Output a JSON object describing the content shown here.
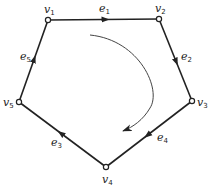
{
  "diagram": {
    "type": "directed-cycle-graph",
    "vertices": [
      {
        "id": "v1",
        "label": "v",
        "sub": "1",
        "x": 48,
        "y": 20,
        "lx": 44,
        "ly": 13
      },
      {
        "id": "v2",
        "label": "v",
        "sub": "2",
        "x": 159,
        "y": 19,
        "lx": 155,
        "ly": 12
      },
      {
        "id": "v3",
        "label": "v",
        "sub": "3",
        "x": 192,
        "y": 101,
        "lx": 197,
        "ly": 106
      },
      {
        "id": "v4",
        "label": "v",
        "sub": "4",
        "x": 106,
        "y": 167,
        "lx": 102,
        "ly": 183
      },
      {
        "id": "v5",
        "label": "v",
        "sub": "5",
        "x": 19,
        "y": 102,
        "lx": 3,
        "ly": 106
      }
    ],
    "edges": [
      {
        "id": "e1",
        "label": "e",
        "sub": "1",
        "from": "v1",
        "to": "v2",
        "lx": 99,
        "ly": 12
      },
      {
        "id": "e2",
        "label": "e",
        "sub": "2",
        "from": "v2",
        "to": "v3",
        "lx": 181,
        "ly": 60
      },
      {
        "id": "e3",
        "label": "e",
        "sub": "3",
        "from": "v4",
        "to": "v5",
        "lx": 51,
        "ly": 146
      },
      {
        "id": "e4",
        "label": "e",
        "sub": "4",
        "from": "v3",
        "to": "v4",
        "lx": 157,
        "ly": 141
      },
      {
        "id": "e5",
        "label": "e",
        "sub": "5",
        "from": "v5",
        "to": "v1",
        "lx": 20,
        "ly": 60
      }
    ],
    "orientation_arrow": {
      "direction": "clockwise"
    },
    "colors": {
      "stroke": "#222222",
      "background": "#ffffff"
    }
  }
}
